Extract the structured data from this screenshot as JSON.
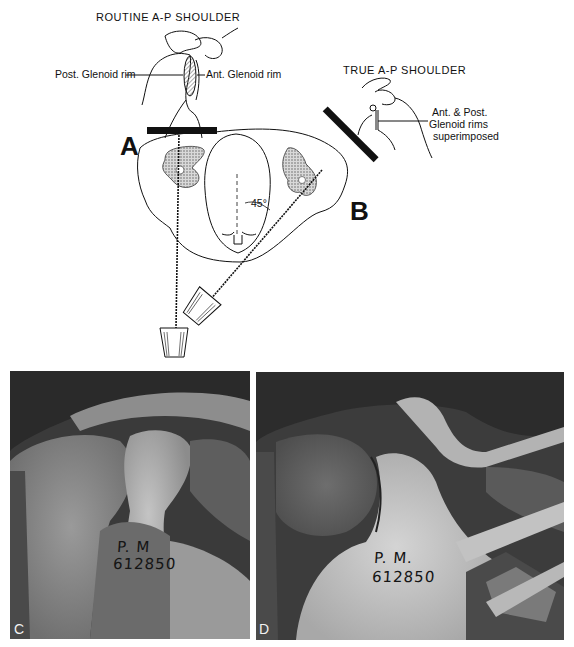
{
  "figure": {
    "top_left_view": {
      "title": "ROUTINE   A-P   SHOULDER",
      "label_left": "Post. Glenoid rim",
      "label_right": "Ant. Glenoid rim"
    },
    "top_right_view": {
      "title": "TRUE   A-P   SHOULDER",
      "label_line1": "Ant. & Post.",
      "label_line2": "Glenoid  rims",
      "label_line3": "superimposed"
    },
    "cross_section": {
      "position_a": "A",
      "position_b": "B",
      "angle": "45°"
    },
    "radiographs": [
      {
        "panel": "C",
        "annotation_line1": "P. M",
        "annotation_line2": "612850"
      },
      {
        "panel": "D",
        "annotation_line1": "P. M.",
        "annotation_line2": "612850"
      }
    ]
  },
  "colors": {
    "ink": "#111111",
    "hatch": "#8a8a8a",
    "xray_dark": "#2e2e2e",
    "xray_light": "#c8c8c8"
  }
}
